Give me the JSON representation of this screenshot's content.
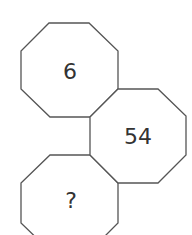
{
  "puzzle": {
    "octagons": [
      {
        "id": "top",
        "label": "6"
      },
      {
        "id": "middle-right",
        "label": "54"
      },
      {
        "id": "bottom",
        "label": "?"
      }
    ]
  },
  "colors": {
    "stroke": "#555555",
    "text": "#333333",
    "background": "#ffffff"
  }
}
